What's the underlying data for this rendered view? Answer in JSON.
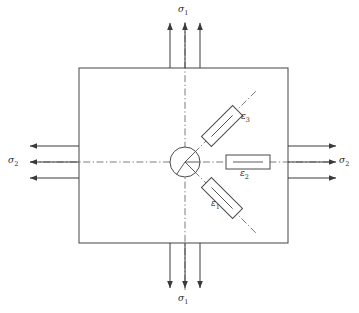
{
  "figure": {
    "kind": "stress-element-strain-rosette",
    "background_color": "#ffffff",
    "line_color": "#3a3a3a",
    "text_color": "#2b2b2b"
  },
  "plate": {
    "name": "plate-body",
    "x": 79,
    "y": 68,
    "width": 209,
    "height": 175,
    "stroke": "#555555"
  },
  "center": {
    "x": 185,
    "y": 162,
    "radius": 15
  },
  "stresses": [
    {
      "id": "sigma1-top",
      "symbol": "σ",
      "subscript": "1",
      "label": "σ1",
      "direction": "up",
      "position": "top",
      "arrow_count": 3,
      "label_x": 181,
      "label_y": 6
    },
    {
      "id": "sigma1-bottom",
      "symbol": "σ",
      "subscript": "1",
      "label": "σ1",
      "direction": "down",
      "position": "bottom",
      "arrow_count": 3,
      "label_x": 181,
      "label_y": 296
    },
    {
      "id": "sigma2-left",
      "symbol": "σ",
      "subscript": "2",
      "label": "σ2",
      "direction": "left",
      "position": "left",
      "arrow_count": 3,
      "label_x": 7,
      "label_y": 157
    },
    {
      "id": "sigma2-right",
      "symbol": "σ",
      "subscript": "2",
      "label": "σ2",
      "direction": "right",
      "position": "right",
      "arrow_count": 3,
      "label_x": 340,
      "label_y": 157
    }
  ],
  "gauges": [
    {
      "id": "gauge-epsilon-1",
      "symbol": "ε",
      "subscript": "1",
      "label": "ε1",
      "angle_deg": 45,
      "orientation": "lower-right diagonal",
      "center_x": 222,
      "center_y": 198,
      "length": 44,
      "width": 14,
      "label_x": 212,
      "label_y": 203
    },
    {
      "id": "gauge-epsilon-2",
      "symbol": "ε",
      "subscript": "2",
      "label": "ε2",
      "angle_deg": 0,
      "orientation": "horizontal",
      "center_x": 248,
      "center_y": 162,
      "length": 44,
      "width": 14,
      "label_x": 241,
      "label_y": 172
    },
    {
      "id": "gauge-epsilon-3",
      "symbol": "ε",
      "subscript": "3",
      "label": "ε3",
      "angle_deg": -45,
      "orientation": "upper-right diagonal",
      "center_x": 222,
      "center_y": 126,
      "length": 44,
      "width": 14,
      "label_x": 242,
      "label_y": 117
    }
  ],
  "axes": [
    {
      "id": "axis-vertical",
      "style": "dash-dot",
      "from_x": 185,
      "from_y": 22,
      "to_x": 185,
      "to_y": 290
    },
    {
      "id": "axis-horizontal",
      "style": "dash-dot",
      "from_x": 30,
      "from_y": 162,
      "to_x": 330,
      "to_y": 162
    },
    {
      "id": "axis-diagonal-up",
      "style": "dash-dot",
      "from_x": 185,
      "from_y": 162,
      "to_x": 254,
      "to_y": 93
    },
    {
      "id": "axis-diagonal-down",
      "style": "dash-dot",
      "from_x": 185,
      "from_y": 162,
      "to_x": 254,
      "to_y": 231
    }
  ]
}
